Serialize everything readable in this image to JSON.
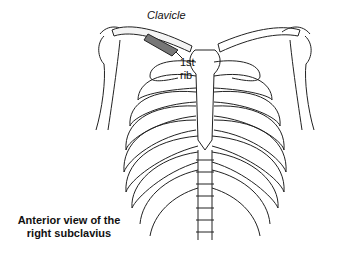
{
  "labels": {
    "clavicle": "Clavicle",
    "first_rib_line1": "1st",
    "first_rib_line2": "rib",
    "caption": "Anterior view of the right subclavius"
  },
  "colors": {
    "line": "#222222",
    "muscle": "#555555",
    "background": "#ffffff"
  }
}
